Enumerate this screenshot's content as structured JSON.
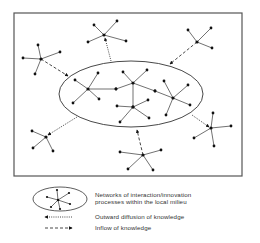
{
  "diagram": {
    "frame": {
      "x": 14,
      "y": 13,
      "w": 228,
      "h": 163
    },
    "milieu_ellipse": {
      "cx": 131,
      "cy": 94,
      "rx": 72,
      "ry": 33
    },
    "inner_networks": [
      {
        "hub": [
          88,
          89
        ],
        "leaves": [
          [
            75,
            80
          ],
          [
            98,
            73
          ],
          [
            73,
            103
          ],
          [
            99,
            99
          ],
          [
            116,
            89
          ]
        ]
      },
      {
        "hub": [
          133,
          83
        ],
        "leaves": [
          [
            123,
            72
          ],
          [
            147,
            70
          ],
          [
            116,
            89
          ],
          [
            155,
            91
          ],
          [
            133,
            107
          ]
        ]
      },
      {
        "hub": [
          133,
          107
        ],
        "leaves": [
          [
            117,
            106
          ],
          [
            148,
            100
          ],
          [
            149,
            118
          ],
          [
            120,
            122
          ]
        ]
      },
      {
        "hub": [
          173,
          98
        ],
        "leaves": [
          [
            164,
            81
          ],
          [
            188,
            85
          ],
          [
            190,
            105
          ],
          [
            166,
            115
          ],
          [
            155,
            91
          ]
        ]
      }
    ],
    "external_networks": [
      {
        "name": "top-left",
        "hub": [
          41,
          59
        ],
        "leaves": [
          [
            38,
            45
          ],
          [
            23,
            58
          ],
          [
            60,
            52
          ],
          [
            35,
            74
          ]
        ]
      },
      {
        "name": "top-middle",
        "hub": [
          104,
          35
        ],
        "leaves": [
          [
            94,
            25
          ],
          [
            117,
            21
          ],
          [
            88,
            42
          ],
          [
            126,
            41
          ]
        ]
      },
      {
        "name": "top-right",
        "hub": [
          197,
          42
        ],
        "leaves": [
          [
            188,
            30
          ],
          [
            211,
            28
          ],
          [
            212,
            48
          ]
        ]
      },
      {
        "name": "bottom-left",
        "hub": [
          46,
          137
        ],
        "leaves": [
          [
            32,
            131
          ],
          [
            33,
            148
          ],
          [
            53,
            151
          ]
        ]
      },
      {
        "name": "bottom-middle",
        "hub": [
          143,
          155
        ],
        "leaves": [
          [
            120,
            152
          ],
          [
            161,
            150
          ],
          [
            128,
            169
          ],
          [
            153,
            170
          ]
        ]
      },
      {
        "name": "bottom-right",
        "hub": [
          211,
          128
        ],
        "leaves": [
          [
            213,
            113
          ],
          [
            231,
            126
          ],
          [
            194,
            138
          ],
          [
            214,
            146
          ]
        ]
      }
    ],
    "flows": [
      {
        "type": "inflow",
        "from": [
          41,
          59
        ],
        "to": [
          68,
          76
        ]
      },
      {
        "type": "outward",
        "from": [
          111,
          61
        ],
        "to": [
          105,
          38
        ]
      },
      {
        "type": "inflow",
        "from": [
          197,
          42
        ],
        "to": [
          170,
          64
        ]
      },
      {
        "type": "outward",
        "from": [
          77,
          117
        ],
        "to": [
          48,
          135
        ]
      },
      {
        "type": "inflow",
        "from": [
          143,
          155
        ],
        "to": [
          137,
          130
        ]
      },
      {
        "type": "outward",
        "from": [
          192,
          115
        ],
        "to": [
          209,
          127
        ]
      }
    ]
  },
  "legend": {
    "items": [
      {
        "key": "networks",
        "label_line1": "Networks of interaction/innovation",
        "label_line2": "processes within the local milieu"
      },
      {
        "key": "outward",
        "label": "Outward diffusion of knowledge"
      },
      {
        "key": "inflow",
        "label": "Inflow of knowledge"
      }
    ]
  },
  "colors": {
    "line": "#333333",
    "node": "#111111",
    "frame": "#555555",
    "text": "#333333"
  }
}
